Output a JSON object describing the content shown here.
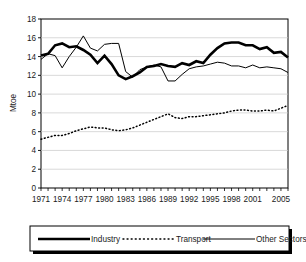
{
  "chart_data": {
    "type": "line",
    "title": "",
    "subtitle": "",
    "xlabel": "",
    "ylabel": "Mtoe",
    "ylim": [
      0,
      18
    ],
    "yticks": [
      0,
      2,
      4,
      6,
      8,
      10,
      12,
      14,
      16,
      18
    ],
    "ytick_labels": [
      "0",
      "2",
      "4",
      "6",
      "8",
      "10",
      "12",
      "14",
      "16",
      "18"
    ],
    "xlim": [
      1971,
      2006
    ],
    "x": [
      1971,
      1972,
      1973,
      1974,
      1975,
      1976,
      1977,
      1978,
      1979,
      1980,
      1981,
      1982,
      1983,
      1984,
      1985,
      1986,
      1987,
      1988,
      1989,
      1990,
      1991,
      1992,
      1993,
      1994,
      1995,
      1996,
      1997,
      1998,
      1999,
      2000,
      2001,
      2002,
      2003,
      2004,
      2005,
      2006
    ],
    "xticks": [
      1971,
      1974,
      1977,
      1980,
      1983,
      1986,
      1989,
      1992,
      1995,
      1998,
      2001,
      2005
    ],
    "xtick_labels": [
      "1971",
      "1974",
      "1977",
      "1980",
      "1983",
      "1986",
      "1989",
      "1992",
      "1995",
      "1998",
      "2001",
      "2005"
    ],
    "grid": true,
    "grid_axis": "y",
    "legend_position": "bottom",
    "series": [
      {
        "name": "Industry",
        "style": "thick-solid",
        "color": "#000000",
        "linewidth": 2.6,
        "values": [
          14.1,
          14.3,
          15.2,
          15.4,
          15.0,
          15.1,
          14.7,
          14.2,
          13.3,
          14.1,
          13.2,
          12.0,
          11.6,
          11.9,
          12.3,
          12.9,
          13.0,
          13.2,
          13.0,
          12.9,
          13.3,
          13.1,
          13.5,
          13.3,
          14.2,
          14.9,
          15.4,
          15.5,
          15.5,
          15.2,
          15.2,
          14.8,
          15.0,
          14.4,
          14.5,
          13.9
        ]
      },
      {
        "name": "Transport",
        "style": "dotted",
        "color": "#000000",
        "linewidth": 1.2,
        "values": [
          5.2,
          5.4,
          5.6,
          5.6,
          5.8,
          6.1,
          6.3,
          6.5,
          6.4,
          6.4,
          6.2,
          6.1,
          6.2,
          6.4,
          6.7,
          7.0,
          7.3,
          7.6,
          7.9,
          7.5,
          7.4,
          7.6,
          7.6,
          7.7,
          7.8,
          7.9,
          8.0,
          8.2,
          8.3,
          8.3,
          8.2,
          8.2,
          8.3,
          8.2,
          8.5,
          8.8
        ]
      },
      {
        "name": "Other Sectors",
        "name_suffix": "****",
        "style": "thin-solid",
        "color": "#000000",
        "linewidth": 1.0,
        "values": [
          13.7,
          14.3,
          14.1,
          12.8,
          14.0,
          15.0,
          16.2,
          14.9,
          14.6,
          15.3,
          15.4,
          15.4,
          12.4,
          11.8,
          12.6,
          12.9,
          13.1,
          12.9,
          11.4,
          11.4,
          12.1,
          12.7,
          12.9,
          13.0,
          13.2,
          13.4,
          13.3,
          13.0,
          13.0,
          12.8,
          13.1,
          12.8,
          12.9,
          12.8,
          12.7,
          12.3
        ]
      }
    ]
  },
  "legend": {
    "items": [
      {
        "label": "Industry",
        "suffix": ""
      },
      {
        "label": "Transport",
        "suffix": ""
      },
      {
        "label": "Other Sectors",
        "suffix": "****"
      }
    ]
  }
}
